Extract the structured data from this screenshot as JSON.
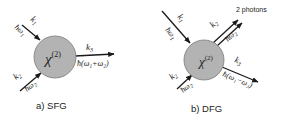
{
  "panels": [
    {
      "id": "sfg",
      "caption": "a) SFG",
      "crystal_label": "χ",
      "crystal_superscript": "(2)",
      "inputs": [
        {
          "wavevector": "k",
          "sub": "1",
          "energy": "ħω",
          "energy_sub": "1"
        },
        {
          "wavevector": "k",
          "sub": "2",
          "energy": "ħω",
          "energy_sub": "2"
        }
      ],
      "outputs": [
        {
          "wavevector": "k",
          "sub": "3",
          "energy": "ħ(ω₁+ω₂)"
        }
      ]
    },
    {
      "id": "dfg",
      "caption": "b) DFG",
      "crystal_label": "χ",
      "crystal_superscript": "(2)",
      "annotation": "2 photons",
      "inputs": [
        {
          "wavevector": "k",
          "sub": "1",
          "energy": "ħω",
          "energy_sub": "1"
        },
        {
          "wavevector": "k",
          "sub": "2",
          "energy": "ħω",
          "energy_sub": "2"
        }
      ],
      "outputs": [
        {
          "wavevector": "k",
          "sub": "2",
          "energy": "ħω",
          "energy_sub": "2"
        },
        {
          "wavevector": "k",
          "sub": "3",
          "energy": "ħ(ω₁−ω₂)"
        }
      ]
    }
  ],
  "colors": {
    "crystal_fill": "#b3b3b3",
    "crystal_stroke": "#7a7a7a",
    "arrow": "#1a1a1a",
    "text": "#222222"
  }
}
